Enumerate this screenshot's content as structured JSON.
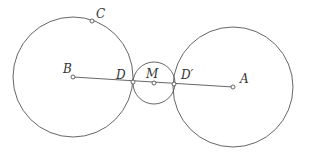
{
  "diagram": {
    "type": "geometry",
    "stroke_color": "#555555",
    "background": "#ffffff",
    "circles": [
      {
        "name": "circle-B",
        "cx": 73,
        "cy": 77,
        "r": 60
      },
      {
        "name": "circle-A",
        "cx": 233,
        "cy": 87,
        "r": 60
      },
      {
        "name": "circle-M",
        "cx": 154,
        "cy": 83,
        "r": 21
      }
    ],
    "segment": {
      "from": "B",
      "to": "A",
      "x1": 73,
      "y1": 77,
      "x2": 233,
      "y2": 87
    },
    "points": [
      {
        "id": "B",
        "label": "B",
        "x": 73,
        "y": 77,
        "lx": 63,
        "ly": 73
      },
      {
        "id": "C",
        "label": "C",
        "x": 92,
        "y": 21,
        "lx": 96,
        "ly": 18
      },
      {
        "id": "D",
        "label": "D",
        "x": 133,
        "y": 82,
        "lx": 116,
        "ly": 79
      },
      {
        "id": "M",
        "label": "M",
        "x": 154,
        "y": 83,
        "lx": 146,
        "ly": 78
      },
      {
        "id": "Dp",
        "label": "D′",
        "x": 174,
        "y": 84,
        "lx": 181,
        "ly": 79
      },
      {
        "id": "A",
        "label": "A",
        "x": 233,
        "y": 87,
        "lx": 240,
        "ly": 83
      }
    ]
  }
}
